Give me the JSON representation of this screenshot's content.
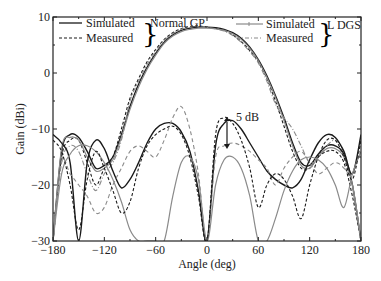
{
  "chart_data": {
    "type": "line",
    "title": "",
    "xlabel": "Angle (deg)",
    "ylabel": "Gain (dBi)",
    "xlim": [
      -180,
      180
    ],
    "ylim": [
      -30,
      10
    ],
    "xticks": [
      -180,
      -120,
      -60,
      0,
      60,
      120,
      180
    ],
    "yticks": [
      10,
      0,
      -10,
      -20,
      -30
    ],
    "grid": false,
    "legend": {
      "position": "top",
      "groups": [
        {
          "label": "Normal GP",
          "entries": [
            "Simulated",
            "Measured"
          ]
        },
        {
          "label": "L DGS",
          "entries": [
            "Simulated",
            "Measured"
          ]
        }
      ]
    },
    "annotations": [
      {
        "text": "5 dB",
        "x": 25,
        "y": -7.5
      }
    ],
    "series": [
      {
        "name": "Normal GP Simulated (E-plane)",
        "style": "solid-dark",
        "x": [
          -180,
          -170,
          -160,
          -150,
          -140,
          -130,
          -120,
          -110,
          -100,
          -90,
          -80,
          -70,
          -60,
          -50,
          -40,
          -30,
          -20,
          -10,
          0,
          10,
          20,
          30,
          40,
          50,
          60,
          70,
          80,
          90,
          100,
          110,
          120,
          130,
          140,
          150,
          160,
          170,
          180
        ],
        "y": [
          -30,
          -14,
          -11,
          -11.5,
          -14,
          -17,
          -16.5,
          -15,
          -11,
          -6,
          -2,
          1,
          3.5,
          5.5,
          6.8,
          7.6,
          8,
          8.2,
          8.2,
          8.1,
          7.8,
          7.2,
          6.2,
          4.6,
          2.4,
          -0.5,
          -4,
          -8,
          -12.5,
          -16,
          -16.5,
          -14.5,
          -13,
          -13,
          -14.5,
          -20,
          -30
        ]
      },
      {
        "name": "Normal GP Measured (E-plane)",
        "style": "dashed-dark",
        "x": [
          -180,
          -170,
          -160,
          -150,
          -140,
          -130,
          -120,
          -110,
          -100,
          -90,
          -80,
          -70,
          -60,
          -50,
          -40,
          -30,
          -20,
          -10,
          0,
          10,
          20,
          30,
          40,
          50,
          60,
          70,
          80,
          90,
          100,
          110,
          120,
          130,
          140,
          150,
          160,
          170,
          180
        ],
        "y": [
          -30,
          -15,
          -12,
          -12,
          -16,
          -20,
          -17,
          -15,
          -10,
          -4.5,
          -1,
          2,
          4.2,
          6,
          7.2,
          7.9,
          8.3,
          8.4,
          8.2,
          8,
          7.6,
          6.8,
          5.6,
          4,
          2,
          -1,
          -5,
          -9.5,
          -14,
          -17,
          -17,
          -15,
          -14,
          -14,
          -16,
          -22,
          -30
        ]
      },
      {
        "name": "L DGS Simulated (E-plane)",
        "style": "solid-gray",
        "x": [
          -180,
          -170,
          -160,
          -150,
          -140,
          -130,
          -120,
          -110,
          -100,
          -90,
          -80,
          -70,
          -60,
          -50,
          -40,
          -30,
          -20,
          -10,
          0,
          10,
          20,
          30,
          40,
          50,
          60,
          70,
          80,
          90,
          100,
          110,
          120,
          130,
          140,
          150,
          160,
          170,
          180
        ],
        "y": [
          -30,
          -13.5,
          -11.5,
          -12,
          -15,
          -17.5,
          -17,
          -15.5,
          -11.5,
          -6.5,
          -2.5,
          0.7,
          3.2,
          5.3,
          6.6,
          7.4,
          7.8,
          8,
          8,
          7.9,
          7.6,
          7,
          6,
          4.4,
          2.2,
          -0.8,
          -4.3,
          -8.5,
          -13,
          -16.5,
          -17,
          -15,
          -13.5,
          -13.5,
          -15,
          -20,
          -30
        ]
      },
      {
        "name": "L DGS Measured (E-plane)",
        "style": "dashdot-gray",
        "x": [
          -180,
          -170,
          -160,
          -150,
          -140,
          -130,
          -120,
          -110,
          -100,
          -90,
          -80,
          -70,
          -60,
          -50,
          -40,
          -30,
          -20,
          -10,
          0,
          10,
          20,
          30,
          40,
          50,
          60,
          70,
          80,
          90,
          100,
          110,
          120,
          130,
          140,
          150,
          160,
          170,
          180
        ],
        "y": [
          -30,
          -16,
          -13,
          -14,
          -18,
          -21,
          -18,
          -16,
          -12,
          -5,
          -1.5,
          1.5,
          3.8,
          5.8,
          7,
          7.8,
          8.2,
          8.3,
          8.1,
          7.9,
          7.5,
          6.7,
          5.5,
          3.8,
          1.8,
          -1.5,
          -5.5,
          -8,
          -10,
          -13,
          -16,
          -15,
          -13,
          -12,
          -14,
          -20,
          -30
        ]
      },
      {
        "name": "Normal GP Simulated (H-plane)",
        "style": "solid-dark",
        "x": [
          -180,
          -170,
          -160,
          -150,
          -140,
          -130,
          -120,
          -110,
          -100,
          -90,
          -80,
          -70,
          -60,
          -50,
          -40,
          -30,
          -20,
          -10,
          0,
          10,
          20,
          30,
          40,
          50,
          60,
          70,
          80,
          90,
          100,
          110,
          120,
          130,
          140,
          150,
          160,
          170,
          180
        ],
        "y": [
          -11,
          -12.5,
          -16,
          -30,
          -16,
          -12,
          -13.5,
          -17.5,
          -20.5,
          -19,
          -16,
          -12.5,
          -10,
          -9,
          -9,
          -10.5,
          -14,
          -21,
          -30,
          -13,
          -9,
          -8.5,
          -10,
          -12.5,
          -15,
          -17.5,
          -19,
          -20,
          -20.5,
          -19,
          -15.5,
          -12.5,
          -11,
          -11.5,
          -14,
          -18,
          -11
        ]
      },
      {
        "name": "L DGS Simulated (H-plane)",
        "style": "solid-gray",
        "x": [
          -180,
          -170,
          -160,
          -150,
          -140,
          -130,
          -120,
          -110,
          -100,
          -90,
          -80,
          -70,
          -60,
          -50,
          -40,
          -30,
          -20,
          -10,
          0,
          10,
          20,
          30,
          40,
          50,
          60,
          70,
          80,
          90,
          100,
          110,
          120,
          130,
          140,
          150,
          160,
          170,
          180
        ],
        "y": [
          -30,
          -18,
          -14.5,
          -13,
          -13,
          -14,
          -16,
          -19,
          -23,
          -28,
          -30,
          -30,
          -30,
          -30,
          -22,
          -16,
          -15,
          -19,
          -30,
          -20,
          -15.5,
          -15,
          -17,
          -22,
          -30,
          -30,
          -26,
          -21,
          -17.5,
          -15.5,
          -15,
          -15.5,
          -17,
          -20,
          -24,
          -18,
          -14
        ]
      },
      {
        "name": "L DGS Measured (H-plane)",
        "style": "dashed-gray",
        "x": [
          -180,
          -170,
          -160,
          -150,
          -140,
          -130,
          -120,
          -110,
          -100,
          -90,
          -80,
          -70,
          -60,
          -50,
          -40,
          -30,
          -20,
          -10,
          0,
          10,
          20,
          30,
          40,
          50,
          60,
          70,
          80,
          90,
          100,
          110,
          120,
          130,
          140,
          150,
          160,
          170,
          180
        ],
        "y": [
          -30,
          -16,
          -18,
          -20,
          -22,
          -25,
          -24,
          -20,
          -17,
          -14,
          -13,
          -14,
          -15,
          -12,
          -8,
          -6,
          -10,
          -18,
          -30,
          -15,
          -13,
          -12.5,
          -13,
          -14,
          -15.5,
          -17,
          -20,
          -17,
          -15,
          -14,
          -16,
          -18,
          -17,
          -16,
          -17,
          -20,
          -30
        ]
      },
      {
        "name": "Normal GP Measured (H-plane)",
        "style": "dashed-dark",
        "x": [
          -180,
          -170,
          -160,
          -150,
          -140,
          -130,
          -120,
          -110,
          -100,
          -90,
          -80,
          -70,
          -60,
          -50,
          -40,
          -30,
          -20,
          -10,
          0,
          10,
          20,
          30,
          40,
          50,
          60,
          70,
          80,
          90,
          100,
          110,
          120,
          130,
          140,
          150,
          160,
          170,
          180
        ],
        "y": [
          -12,
          -14,
          -20,
          -28,
          -19,
          -14,
          -17,
          -21,
          -25,
          -23,
          -17,
          -13,
          -11,
          -10,
          -9.5,
          -11,
          -15,
          -22,
          -30,
          -11,
          -8,
          -9,
          -12,
          -17,
          -24,
          -20,
          -18,
          -19,
          -22,
          -26,
          -20,
          -15,
          -12,
          -12,
          -15,
          -19,
          -12
        ]
      }
    ]
  },
  "legend_labels": {
    "simulated": "Simulated",
    "measured": "Measured",
    "group1": "Normal GP",
    "group2": "L DGS"
  },
  "axis": {
    "xlabel": "Angle (deg)",
    "ylabel": "Gain (dBi)"
  },
  "annotation_text": "5 dB",
  "colors": {
    "dark": "#1a1a1a",
    "gray": "#8a8a8a",
    "frame": "#222222"
  }
}
